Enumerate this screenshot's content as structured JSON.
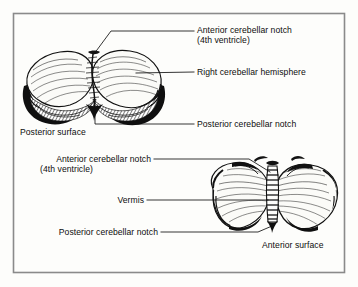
{
  "figure": {
    "domain": "anatomical-illustration",
    "frame": {
      "border_color": "#808080",
      "background_color": "#fdfdfb"
    },
    "ink_color": "#111111",
    "text_color": "#0d0d0d",
    "views": [
      {
        "id": "posterior-view",
        "name": "Cerebellum posterior (superior) view",
        "caption": "Posterior surface",
        "position": "upper-left"
      },
      {
        "id": "anterior-view",
        "name": "Cerebellum anterior (inferior) view",
        "caption": "Anterior surface",
        "position": "lower-right"
      }
    ],
    "labels": [
      {
        "id": "anterior-notch-top",
        "line1": "Anterior cerebellar notch",
        "line2": "(4th ventricle)",
        "view": "posterior-view",
        "leader": "elbow"
      },
      {
        "id": "right-hemisphere",
        "line1": "Right cerebellar hemisphere",
        "line2": "",
        "view": "posterior-view",
        "leader": "straight"
      },
      {
        "id": "posterior-notch-top",
        "line1": "Posterior cerebellar notch",
        "line2": "",
        "view": "posterior-view",
        "leader": "elbow"
      },
      {
        "id": "posterior-surface",
        "line1": "Posterior surface",
        "line2": "",
        "view": "posterior-view",
        "leader": "none"
      },
      {
        "id": "anterior-notch-bottom",
        "line1": "Anterior cerebellar notch",
        "line2": "(4th ventricle)",
        "view": "anterior-view",
        "leader": "elbow"
      },
      {
        "id": "vermis",
        "line1": "Vermis",
        "line2": "",
        "view": "anterior-view",
        "leader": "straight"
      },
      {
        "id": "posterior-notch-bottom",
        "line1": "Posterior cerebellar notch",
        "line2": "",
        "view": "anterior-view",
        "leader": "elbow"
      },
      {
        "id": "anterior-surface",
        "line1": "Anterior surface",
        "line2": "",
        "view": "anterior-view",
        "leader": "none"
      }
    ]
  }
}
